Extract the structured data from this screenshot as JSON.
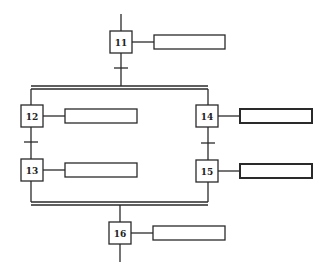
{
  "diagram": {
    "type": "GRAFCET / SFC",
    "steps": [
      {
        "id": "11",
        "label": "11"
      },
      {
        "id": "12",
        "label": "12"
      },
      {
        "id": "13",
        "label": "13"
      },
      {
        "id": "14",
        "label": "14"
      },
      {
        "id": "15",
        "label": "15"
      },
      {
        "id": "16",
        "label": "16"
      }
    ],
    "actions": [
      {
        "step": "11",
        "text": ""
      },
      {
        "step": "12",
        "text": ""
      },
      {
        "step": "13",
        "text": ""
      },
      {
        "step": "14",
        "text": ""
      },
      {
        "step": "15",
        "text": ""
      },
      {
        "step": "16",
        "text": ""
      }
    ],
    "transitions": [
      {
        "from": "11",
        "to": "divergence"
      },
      {
        "from": "12",
        "to": "13"
      },
      {
        "from": "14",
        "to": "15"
      }
    ],
    "parallel": {
      "divergence_after": "11",
      "convergence_before": "16",
      "branches": [
        [
          "12",
          "13"
        ],
        [
          "14",
          "15"
        ]
      ]
    }
  }
}
